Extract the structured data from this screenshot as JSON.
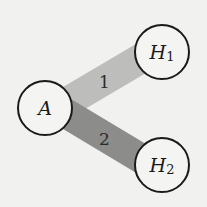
{
  "diagram": {
    "type": "graph",
    "background": "#f1f1ef",
    "nodes": [
      {
        "id": "A",
        "label": "A",
        "subscript": "",
        "cx": 45,
        "cy": 108,
        "r": 27
      },
      {
        "id": "H1",
        "label": "H",
        "subscript": "1",
        "cx": 162,
        "cy": 52,
        "r": 27
      },
      {
        "id": "H2",
        "label": "H",
        "subscript": "2",
        "cx": 162,
        "cy": 165,
        "r": 27
      }
    ],
    "edges": [
      {
        "from": "A",
        "to": "H1",
        "label": "1",
        "color": "#bdbdbb",
        "width": 30
      },
      {
        "from": "A",
        "to": "H2",
        "label": "2",
        "color": "#8c8c8a",
        "width": 30
      }
    ],
    "node_stroke": "#1a1a1a",
    "node_fill": "#f4f4f2"
  }
}
